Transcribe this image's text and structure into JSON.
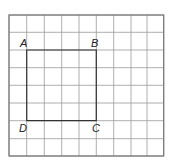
{
  "diagram": {
    "grid": {
      "columns": 9,
      "rows": 8,
      "x_lines": [
        9,
        26.7,
        44.3,
        61.7,
        79,
        96.3,
        113.7,
        131,
        147,
        163.7
      ],
      "y_lines": [
        15,
        32.3,
        50,
        67.7,
        85.3,
        103,
        120.7,
        138.7,
        156
      ],
      "line_color": "#9a9a9a",
      "border_color": "#777777"
    },
    "square": {
      "stroke_color": "#333333",
      "vertices": {
        "A": {
          "label": "A",
          "col": 1,
          "row": 2
        },
        "B": {
          "label": "B",
          "col": 5,
          "row": 2
        },
        "C": {
          "label": "C",
          "col": 5,
          "row": 6
        },
        "D": {
          "label": "D",
          "col": 1,
          "row": 6
        }
      }
    }
  }
}
